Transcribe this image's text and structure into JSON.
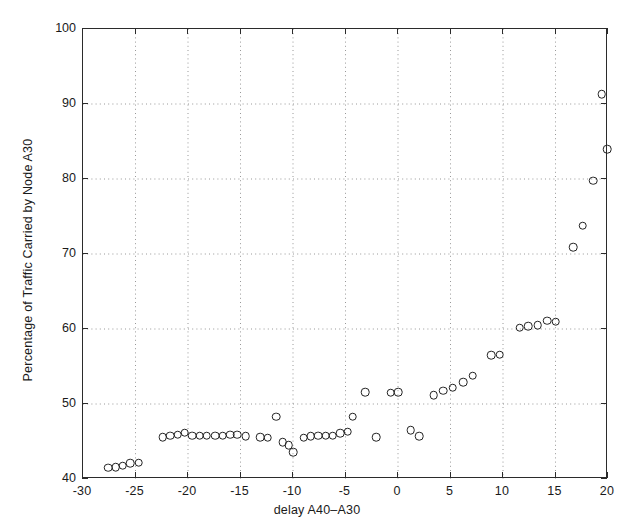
{
  "chart_data": {
    "type": "scatter",
    "title": "",
    "xlabel": "delay A40–A30",
    "ylabel": "Percentage of Traffic Carried by Node A30",
    "xlim": [
      -30,
      20
    ],
    "ylim": [
      40,
      100
    ],
    "xticks": [
      -30,
      -25,
      -20,
      -15,
      -10,
      -5,
      0,
      5,
      10,
      15,
      20
    ],
    "xtick_labels": [
      "-30",
      "-25",
      "-20",
      "-15",
      "-10",
      "-5",
      "0",
      "5",
      "10",
      "15",
      "20"
    ],
    "yticks": [
      40,
      50,
      60,
      70,
      80,
      90,
      100
    ],
    "ytick_labels": [
      "40",
      "50",
      "60",
      "70",
      "80",
      "90",
      "100"
    ],
    "grid": true,
    "grid_style": "dotted",
    "marker": "open-circle",
    "marker_color": "#222222",
    "points": [
      {
        "x": -27.6,
        "y": 41.5
      },
      {
        "x": -26.9,
        "y": 41.6
      },
      {
        "x": -26.2,
        "y": 41.8
      },
      {
        "x": -25.5,
        "y": 42.1
      },
      {
        "x": -24.7,
        "y": 42.2
      },
      {
        "x": -22.4,
        "y": 45.6
      },
      {
        "x": -21.7,
        "y": 45.8
      },
      {
        "x": -21.0,
        "y": 45.9
      },
      {
        "x": -20.3,
        "y": 46.2
      },
      {
        "x": -19.6,
        "y": 45.8
      },
      {
        "x": -18.9,
        "y": 45.8
      },
      {
        "x": -18.2,
        "y": 45.8
      },
      {
        "x": -17.4,
        "y": 45.8
      },
      {
        "x": -16.7,
        "y": 45.8
      },
      {
        "x": -16.0,
        "y": 45.9
      },
      {
        "x": -15.3,
        "y": 45.9
      },
      {
        "x": -14.5,
        "y": 45.7
      },
      {
        "x": -13.1,
        "y": 45.6
      },
      {
        "x": -12.4,
        "y": 45.5
      },
      {
        "x": -11.6,
        "y": 48.3
      },
      {
        "x": -11.0,
        "y": 44.9
      },
      {
        "x": -10.4,
        "y": 44.5
      },
      {
        "x": -10.0,
        "y": 43.6
      },
      {
        "x": -9.0,
        "y": 45.5
      },
      {
        "x": -8.3,
        "y": 45.7
      },
      {
        "x": -7.6,
        "y": 45.8
      },
      {
        "x": -6.9,
        "y": 45.8
      },
      {
        "x": -6.2,
        "y": 45.8
      },
      {
        "x": -5.5,
        "y": 46.1
      },
      {
        "x": -4.8,
        "y": 46.3
      },
      {
        "x": -4.3,
        "y": 48.3
      },
      {
        "x": -3.1,
        "y": 51.6
      },
      {
        "x": -2.1,
        "y": 45.6
      },
      {
        "x": -0.7,
        "y": 51.5
      },
      {
        "x": 0.0,
        "y": 51.6
      },
      {
        "x": 1.2,
        "y": 46.5
      },
      {
        "x": 2.0,
        "y": 45.7
      },
      {
        "x": 3.4,
        "y": 51.2
      },
      {
        "x": 4.3,
        "y": 51.8
      },
      {
        "x": 5.2,
        "y": 52.2
      },
      {
        "x": 6.2,
        "y": 52.9
      },
      {
        "x": 7.1,
        "y": 53.8
      },
      {
        "x": 8.9,
        "y": 56.5
      },
      {
        "x": 9.7,
        "y": 56.6
      },
      {
        "x": 11.6,
        "y": 60.2
      },
      {
        "x": 12.4,
        "y": 60.4
      },
      {
        "x": 13.3,
        "y": 60.5
      },
      {
        "x": 14.2,
        "y": 61.1
      },
      {
        "x": 15.0,
        "y": 61.0
      },
      {
        "x": 16.7,
        "y": 70.9
      },
      {
        "x": 17.6,
        "y": 73.8
      },
      {
        "x": 18.6,
        "y": 79.8
      },
      {
        "x": 19.4,
        "y": 91.3
      },
      {
        "x": 19.9,
        "y": 84.0
      }
    ]
  }
}
